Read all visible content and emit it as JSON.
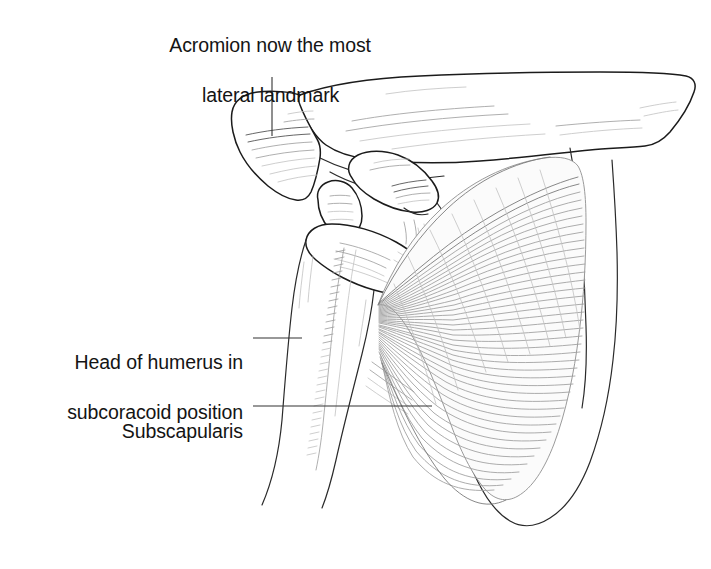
{
  "figure": {
    "background_color": "#ffffff",
    "ink_color": "#1b1b1b",
    "muscle_tone_color": "#9d9d9d",
    "width": 711,
    "height": 569
  },
  "labels": {
    "acromion": {
      "line1": "Acromion now the most",
      "line2": "lateral landmark",
      "full": "Acromion now the most lateral landmark"
    },
    "humerus": {
      "line1": "Head of humerus in",
      "line2": "subcoracoid position",
      "full": "Head of humerus in subcoracoid position"
    },
    "subscapularis": {
      "line1": "Subscapularis",
      "full": "Subscapularis"
    }
  },
  "leaders": [
    {
      "name": "acromion-leader",
      "orientation": "vertical"
    },
    {
      "name": "humerus-leader",
      "orientation": "horizontal"
    },
    {
      "name": "subscapularis-leader",
      "orientation": "horizontal"
    }
  ],
  "structures": [
    {
      "name": "clavicle",
      "kind": "bone"
    },
    {
      "name": "acromion",
      "kind": "bone"
    },
    {
      "name": "coracoid-process",
      "kind": "bone"
    },
    {
      "name": "humeral-head",
      "kind": "bone"
    },
    {
      "name": "humerus-shaft",
      "kind": "bone"
    },
    {
      "name": "scapula-body",
      "kind": "bone"
    },
    {
      "name": "subscapularis-muscle",
      "kind": "muscle"
    }
  ]
}
